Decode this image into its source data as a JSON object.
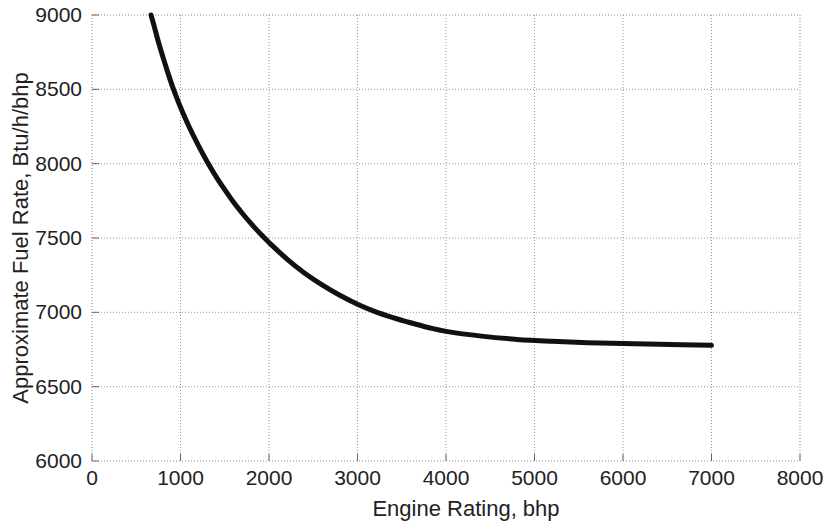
{
  "chart_data": {
    "type": "line",
    "title": "",
    "xlabel": "Engine Rating, bhp",
    "ylabel": "Approximate Fuel Rate, Btu/h/bhp",
    "xlim": [
      0,
      8000
    ],
    "ylim": [
      6000,
      9000
    ],
    "xticks": [
      0,
      1000,
      2000,
      3000,
      4000,
      5000,
      6000,
      7000,
      8000
    ],
    "yticks": [
      6000,
      6500,
      7000,
      7500,
      8000,
      8500,
      9000
    ],
    "xtick_labels": [
      "0",
      "1000",
      "2000",
      "3000",
      "4000",
      "5000",
      "6000",
      "7000",
      "8000"
    ],
    "ytick_labels": [
      "6000",
      "6500",
      "7000",
      "7500",
      "8000",
      "8500",
      "9000"
    ],
    "grid": true,
    "grid_style": "dotted",
    "grid_color": "#999999",
    "legend": null,
    "series": [
      {
        "name": "Approximate Fuel Rate",
        "color": "#111111",
        "line_width": 5,
        "x": [
          667,
          700,
          750,
          800,
          850,
          900,
          950,
          1000,
          1100,
          1200,
          1300,
          1400,
          1500,
          1600,
          1700,
          1800,
          1900,
          2000,
          2200,
          2400,
          2600,
          2800,
          3000,
          3200,
          3400,
          3600,
          3800,
          4000,
          4400,
          4800,
          5200,
          5600,
          6000,
          6400,
          7000
        ],
        "y": [
          9000,
          8930,
          8820,
          8720,
          8625,
          8535,
          8455,
          8380,
          8245,
          8125,
          8015,
          7915,
          7825,
          7740,
          7665,
          7595,
          7530,
          7470,
          7360,
          7265,
          7185,
          7115,
          7055,
          7005,
          6965,
          6930,
          6898,
          6872,
          6840,
          6818,
          6805,
          6796,
          6790,
          6786,
          6778
        ]
      }
    ]
  },
  "axes": {
    "x_title": "Engine Rating, bhp",
    "y_title": "Approximate Fuel Rate, Btu/h/bhp"
  }
}
